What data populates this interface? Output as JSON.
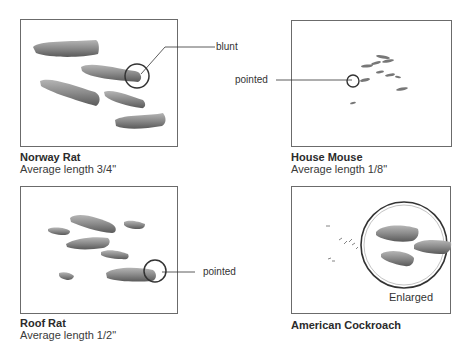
{
  "panels": [
    {
      "id": "norway-rat",
      "title": "Norway Rat",
      "subtitle": "Average length 3/4\"",
      "callout": "blunt"
    },
    {
      "id": "house-mouse",
      "title": "House Mouse",
      "subtitle": "Average length 1/8\"",
      "callout": "pointed"
    },
    {
      "id": "roof-rat",
      "title": "Roof Rat",
      "subtitle": "Average length 1/2\"",
      "callout": "pointed"
    },
    {
      "id": "american-cockroach",
      "title": "American Cockroach",
      "subtitle": "",
      "callout": "Enlarged"
    }
  ],
  "colors": {
    "dropping": "#8a8a8a",
    "dropping_dark": "#5e5e5e",
    "border": "#6b6b6b",
    "line": "#444444"
  }
}
